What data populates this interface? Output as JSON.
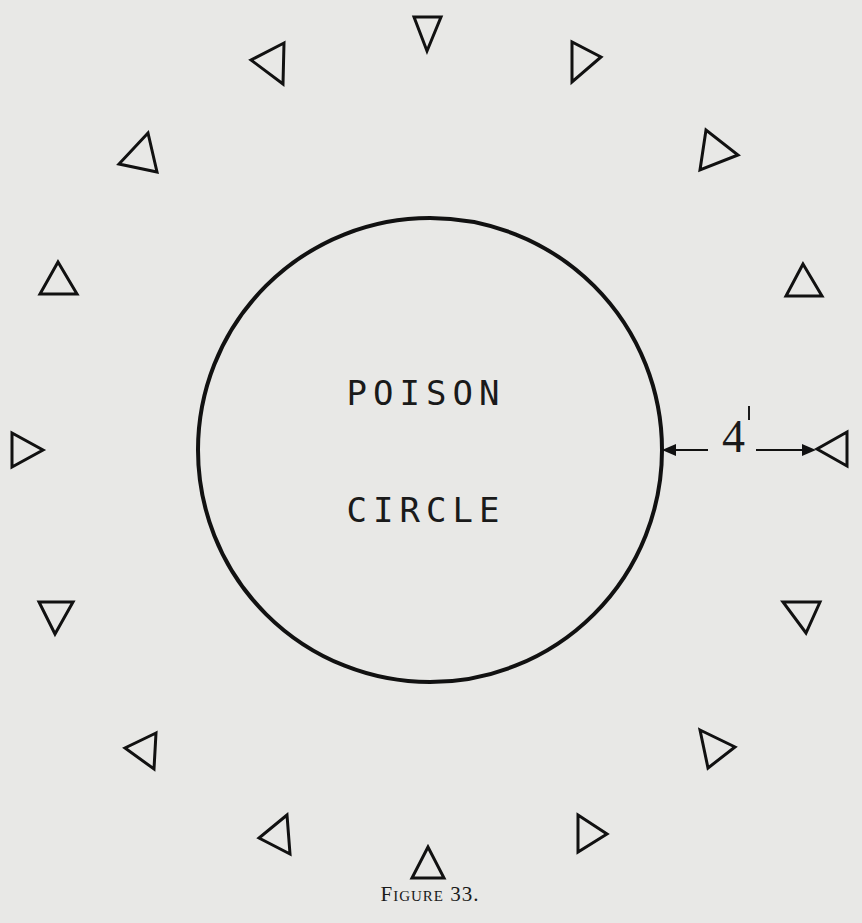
{
  "figure": {
    "caption": "Figure 33.",
    "circle_label_line1": "POISON",
    "circle_label_line2": "CIRCLE",
    "dimension_value": "4",
    "dimension_unit_mark": "'",
    "dimension_meaning": "4 feet between circle edge and player markers"
  },
  "diagram": {
    "circle": {
      "cx": 430,
      "cy": 450,
      "r": 232,
      "stroke": "#111111"
    },
    "marker_count": 16,
    "markers": [
      {
        "name": "marker-top",
        "x": 427,
        "y": 33,
        "dir": "down"
      },
      {
        "name": "marker-top-right-1",
        "x": 586,
        "y": 63,
        "dir": "right"
      },
      {
        "name": "marker-top-right-2",
        "x": 719,
        "y": 150,
        "dir": "right"
      },
      {
        "name": "marker-right-1",
        "x": 803,
        "y": 282,
        "dir": "up"
      },
      {
        "name": "marker-right",
        "x": 832,
        "y": 449,
        "dir": "left"
      },
      {
        "name": "marker-right-2",
        "x": 801,
        "y": 617,
        "dir": "down"
      },
      {
        "name": "marker-bottom-right-2",
        "x": 717,
        "y": 747,
        "dir": "right"
      },
      {
        "name": "marker-bottom-right-1",
        "x": 590,
        "y": 833,
        "dir": "right"
      },
      {
        "name": "marker-bottom",
        "x": 428,
        "y": 862,
        "dir": "up"
      },
      {
        "name": "marker-bottom-left-1",
        "x": 274,
        "y": 834,
        "dir": "left"
      },
      {
        "name": "marker-bottom-left-2",
        "x": 143,
        "y": 749,
        "dir": "left"
      },
      {
        "name": "marker-left-2",
        "x": 56,
        "y": 616,
        "dir": "down"
      },
      {
        "name": "marker-left",
        "x": 28,
        "y": 449,
        "dir": "right"
      },
      {
        "name": "marker-left-1",
        "x": 58,
        "y": 278,
        "dir": "up"
      },
      {
        "name": "marker-top-left-2",
        "x": 138,
        "y": 152,
        "dir": "up"
      },
      {
        "name": "marker-top-left-1",
        "x": 270,
        "y": 63,
        "dir": "left"
      }
    ],
    "ink_color": "#111111",
    "paper_color": "#e8e8e6"
  }
}
